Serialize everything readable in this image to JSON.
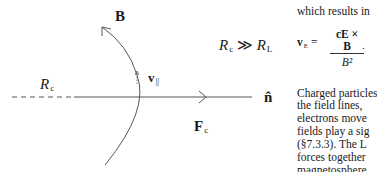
{
  "figure": {
    "labels": {
      "field": "B",
      "v_parallel": "v",
      "v_parallel_sub": "||",
      "radius": "R",
      "radius_sub": "c",
      "normal": "n̂",
      "force": "F",
      "force_sub": "c",
      "condition_left": "R",
      "condition_left_sub": "c",
      "condition_op": "≫",
      "condition_right": "R",
      "condition_right_sub": "L"
    }
  },
  "text": {
    "line1": "which results in",
    "equation": {
      "lhs": "v",
      "lhs_sub": "E",
      "equals": "=",
      "numerator": "cE × B",
      "denominator": "B²",
      "trail": "."
    },
    "paragraph": [
      "Charged particles",
      "the field lines,",
      "electrons move",
      "fields play a sig",
      "(§7.3.3). The L",
      "forces together",
      "magnetosphere"
    ]
  }
}
